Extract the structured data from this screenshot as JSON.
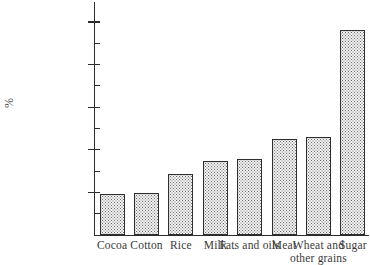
{
  "chart_data": {
    "type": "bar",
    "title": "",
    "subtitle": "",
    "xlabel": "",
    "ylabel": "%",
    "ylim": [
      0,
      105
    ],
    "grid": false,
    "legend": null,
    "categories": [
      "Cocoa",
      "Cotton",
      "Rice",
      "Milk",
      "Fats and oils",
      "Meat",
      "Wheat and other grains",
      "Sugar"
    ],
    "category_lines": [
      [
        "Cocoa"
      ],
      [
        "Cotton"
      ],
      [
        "Rice"
      ],
      [
        "Milk"
      ],
      [
        "Fats and oils"
      ],
      [
        "Meat"
      ],
      [
        "Wheat and",
        "other grains"
      ],
      [
        "Sugar"
      ]
    ],
    "values": [
      19,
      19.5,
      28.5,
      34.5,
      35.5,
      45,
      46,
      96
    ],
    "y_major_ticks": [
      20,
      40,
      60,
      80,
      100
    ],
    "y_major_tick_labels": [
      "20",
      "40",
      "60",
      "80",
      "100"
    ],
    "y_minor_ticks": [
      10,
      30,
      50,
      70,
      90
    ],
    "bar_style": {
      "fill": "stipple-dots",
      "fill_color": "#f2f2f2",
      "dot_color": "#6e6e6e",
      "outline_color": "#2e2e2e"
    },
    "axis_color": "#2c2c2c",
    "text_color": "#3a3a3a",
    "background": "#ffffff"
  }
}
